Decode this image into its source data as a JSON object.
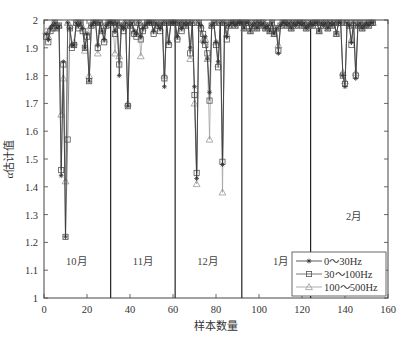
{
  "chart_data": {
    "type": "line",
    "title": "",
    "xlabel": "样本数量",
    "ylabel": "α估计值",
    "xlim": [
      0,
      160
    ],
    "ylim": [
      1,
      2
    ],
    "xticks": [
      0,
      20,
      40,
      60,
      80,
      100,
      120,
      140,
      160
    ],
    "yticks": [
      1,
      1.1,
      1.2,
      1.3,
      1.4,
      1.5,
      1.6,
      1.7,
      1.8,
      1.9,
      2
    ],
    "grid": false,
    "legend_position": "lower right",
    "month_dividers": [
      31,
      61,
      92,
      124
    ],
    "month_labels": [
      {
        "text": "10月",
        "x": 15,
        "y": 1.12
      },
      {
        "text": "11月",
        "x": 46,
        "y": 1.12
      },
      {
        "text": "12月",
        "x": 76,
        "y": 1.12
      },
      {
        "text": "1月",
        "x": 110,
        "y": 1.12
      },
      {
        "text": "2月",
        "x": 144,
        "y": 1.28
      }
    ],
    "x": [
      1,
      2,
      3,
      4,
      5,
      6,
      7,
      8,
      9,
      10,
      11,
      12,
      13,
      14,
      15,
      16,
      17,
      18,
      19,
      20,
      21,
      22,
      23,
      24,
      25,
      26,
      27,
      28,
      29,
      30,
      31,
      32,
      33,
      34,
      35,
      36,
      37,
      38,
      39,
      40,
      41,
      42,
      43,
      44,
      45,
      46,
      47,
      48,
      49,
      50,
      51,
      52,
      53,
      54,
      55,
      56,
      57,
      58,
      59,
      60,
      61,
      62,
      63,
      64,
      65,
      66,
      67,
      68,
      69,
      70,
      71,
      72,
      73,
      74,
      75,
      76,
      77,
      78,
      79,
      80,
      81,
      82,
      83,
      84,
      85,
      86,
      87,
      88,
      89,
      90,
      91,
      92,
      93,
      94,
      95,
      96,
      97,
      98,
      99,
      100,
      101,
      102,
      103,
      104,
      105,
      106,
      107,
      108,
      109,
      110,
      111,
      112,
      113,
      114,
      115,
      116,
      117,
      118,
      119,
      120,
      121,
      122,
      123,
      124,
      125,
      126,
      127,
      128,
      129,
      130,
      131,
      132,
      133,
      134,
      135,
      136,
      137,
      138,
      139,
      140,
      141,
      142,
      143,
      144,
      145,
      146,
      147,
      148,
      149,
      150,
      151,
      152,
      153
    ],
    "series": [
      {
        "name": "0～30Hz",
        "marker": "asterisk",
        "color": "#333333",
        "values": [
          1.95,
          1.93,
          1.97,
          1.98,
          1.99,
          1.97,
          1.98,
          1.44,
          1.85,
          1.22,
          1.99,
          1.97,
          1.91,
          1.91,
          1.99,
          1.98,
          1.99,
          1.97,
          1.9,
          1.95,
          1.78,
          1.98,
          1.99,
          1.99,
          1.91,
          1.99,
          1.96,
          1.93,
          1.98,
          1.99,
          1.99,
          1.99,
          1.96,
          1.99,
          1.8,
          1.98,
          1.97,
          1.99,
          1.69,
          1.98,
          1.99,
          1.96,
          1.95,
          1.99,
          1.94,
          1.97,
          1.98,
          1.99,
          1.99,
          1.99,
          1.96,
          1.99,
          1.98,
          1.97,
          1.99,
          1.76,
          1.99,
          1.92,
          1.99,
          1.99,
          1.99,
          1.94,
          1.99,
          1.97,
          1.99,
          1.98,
          1.99,
          1.9,
          1.99,
          1.76,
          1.43,
          1.99,
          1.98,
          1.92,
          1.94,
          1.86,
          1.74,
          1.98,
          1.99,
          1.92,
          1.85,
          1.99,
          1.48,
          1.99,
          1.94,
          1.98,
          1.99,
          1.99,
          1.98,
          1.99,
          1.99,
          1.99,
          1.97,
          1.99,
          1.99,
          1.96,
          1.98,
          1.99,
          1.97,
          1.99,
          1.98,
          1.99,
          1.97,
          1.98,
          1.96,
          1.99,
          1.95,
          1.97,
          1.88,
          1.98,
          1.99,
          1.99,
          1.98,
          1.99,
          1.97,
          1.99,
          1.98,
          1.99,
          1.99,
          1.98,
          1.99,
          1.97,
          1.98,
          1.99,
          1.98,
          1.99,
          1.99,
          1.96,
          1.99,
          1.98,
          1.99,
          1.97,
          1.99,
          1.98,
          1.99,
          1.95,
          1.99,
          1.99,
          1.8,
          1.76,
          1.99,
          1.98,
          1.92,
          1.99,
          1.79,
          1.98,
          1.99,
          1.97,
          1.98,
          1.99,
          1.98,
          1.99,
          1.99
        ]
      },
      {
        "name": "30～100Hz",
        "marker": "square",
        "color": "#555555",
        "values": [
          1.94,
          1.92,
          1.96,
          1.97,
          1.99,
          1.97,
          1.98,
          1.46,
          1.84,
          1.22,
          1.57,
          1.97,
          1.9,
          1.91,
          1.99,
          1.97,
          1.99,
          1.96,
          1.9,
          1.94,
          1.78,
          1.98,
          1.99,
          1.99,
          1.9,
          1.99,
          1.96,
          1.92,
          1.98,
          1.99,
          1.99,
          1.99,
          1.95,
          1.99,
          1.84,
          1.98,
          1.96,
          1.99,
          1.69,
          1.98,
          1.99,
          1.95,
          1.94,
          1.99,
          1.93,
          1.96,
          1.98,
          1.99,
          1.99,
          1.99,
          1.95,
          1.99,
          1.98,
          1.96,
          1.99,
          1.79,
          1.99,
          1.91,
          1.99,
          1.99,
          1.99,
          1.93,
          1.99,
          1.96,
          1.99,
          1.98,
          1.99,
          1.88,
          1.99,
          1.73,
          1.45,
          1.99,
          1.97,
          1.95,
          1.91,
          1.88,
          1.71,
          1.98,
          1.99,
          1.91,
          1.83,
          1.99,
          1.49,
          1.99,
          1.93,
          1.98,
          1.99,
          1.99,
          1.98,
          1.99,
          1.99,
          1.99,
          1.97,
          1.99,
          1.99,
          1.96,
          1.98,
          1.99,
          1.97,
          1.99,
          1.98,
          1.99,
          1.97,
          1.98,
          1.96,
          1.99,
          1.95,
          1.97,
          1.89,
          1.98,
          1.99,
          1.99,
          1.98,
          1.99,
          1.97,
          1.99,
          1.98,
          1.99,
          1.99,
          1.98,
          1.99,
          1.97,
          1.98,
          1.99,
          1.98,
          1.99,
          1.99,
          1.96,
          1.99,
          1.98,
          1.99,
          1.97,
          1.99,
          1.98,
          1.99,
          1.95,
          1.99,
          1.99,
          1.8,
          1.77,
          1.99,
          1.98,
          1.91,
          1.99,
          1.8,
          1.98,
          1.99,
          1.97,
          1.98,
          1.99,
          1.98,
          1.99,
          1.99
        ]
      },
      {
        "name": "100～500Hz",
        "marker": "triangle",
        "color": "#999999",
        "values": [
          1.96,
          1.94,
          1.97,
          1.98,
          1.99,
          1.98,
          1.98,
          1.66,
          1.79,
          1.42,
          1.99,
          1.98,
          1.91,
          1.92,
          1.99,
          1.98,
          1.99,
          1.97,
          1.89,
          1.96,
          1.8,
          1.98,
          1.99,
          1.99,
          1.88,
          1.99,
          1.97,
          1.93,
          1.98,
          1.99,
          1.99,
          1.99,
          1.88,
          1.99,
          1.87,
          1.98,
          1.97,
          1.99,
          1.7,
          1.98,
          1.99,
          1.96,
          1.95,
          1.99,
          1.87,
          1.97,
          1.98,
          1.99,
          1.99,
          1.99,
          1.96,
          1.99,
          1.98,
          1.97,
          1.99,
          1.8,
          1.99,
          1.92,
          1.99,
          1.99,
          1.99,
          1.94,
          1.99,
          1.97,
          1.99,
          1.98,
          1.99,
          1.86,
          1.99,
          1.7,
          1.41,
          1.99,
          1.98,
          1.93,
          1.93,
          1.86,
          1.57,
          1.98,
          1.99,
          1.92,
          1.84,
          1.99,
          1.38,
          1.99,
          1.95,
          1.98,
          1.99,
          1.99,
          1.98,
          1.99,
          1.99,
          1.99,
          1.97,
          1.99,
          1.99,
          1.96,
          1.98,
          1.99,
          1.97,
          1.99,
          1.98,
          1.99,
          1.97,
          1.98,
          1.96,
          1.99,
          1.95,
          1.97,
          1.91,
          1.98,
          1.99,
          1.99,
          1.98,
          1.99,
          1.97,
          1.99,
          1.98,
          1.99,
          1.99,
          1.98,
          1.99,
          1.97,
          1.98,
          1.99,
          1.98,
          1.99,
          1.99,
          1.96,
          1.99,
          1.98,
          1.99,
          1.97,
          1.99,
          1.98,
          1.99,
          1.95,
          1.99,
          1.99,
          1.81,
          1.78,
          1.99,
          1.98,
          1.93,
          1.99,
          1.81,
          1.98,
          1.99,
          1.97,
          1.98,
          1.99,
          1.98,
          1.99,
          1.99
        ]
      }
    ]
  }
}
